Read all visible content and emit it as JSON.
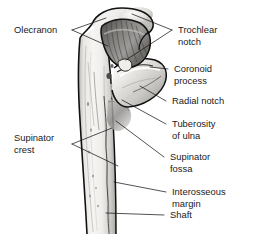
{
  "figure": {
    "background_color": "#ffffff",
    "text_color": "#1a1a1a",
    "line_color": "#1a1a1a",
    "bone_fill_light": "#f2f1ef",
    "bone_fill_mid": "#d9d7d4",
    "bone_fill_dark": "#8d8b89",
    "notch_shadow": "#6f6e6c"
  },
  "labels": {
    "left": [
      {
        "id": "olecranon",
        "line1": "Olecranon",
        "line2": ""
      },
      {
        "id": "supinator-crest",
        "line1": "Supinator",
        "line2": "crest"
      }
    ],
    "right": [
      {
        "id": "trochlear-notch",
        "line1": "Trochlear",
        "line2": "notch"
      },
      {
        "id": "coronoid-process",
        "line1": "Coronoid",
        "line2": "process"
      },
      {
        "id": "radial-notch",
        "line1": "Radial notch",
        "line2": ""
      },
      {
        "id": "tuberosity-of-ulna",
        "line1": "Tuberosity",
        "line2": "of ulna"
      },
      {
        "id": "supinator-fossa",
        "line1": "Supinator",
        "line2": "fossa"
      },
      {
        "id": "interosseous-margin",
        "line1": "Interosseous",
        "line2": "margin"
      },
      {
        "id": "shaft",
        "line1": "Shaft",
        "line2": ""
      }
    ]
  },
  "structures": [
    {
      "id": "olecranon",
      "name": "Olecranon"
    },
    {
      "id": "trochlear-notch",
      "name": "Trochlear notch"
    },
    {
      "id": "coronoid-process",
      "name": "Coronoid process"
    },
    {
      "id": "radial-notch",
      "name": "Radial notch"
    },
    {
      "id": "tuberosity-of-ulna",
      "name": "Tuberosity of ulna"
    },
    {
      "id": "supinator-fossa",
      "name": "Supinator fossa"
    },
    {
      "id": "supinator-crest",
      "name": "Supinator crest"
    },
    {
      "id": "interosseous-margin",
      "name": "Interosseous margin"
    },
    {
      "id": "shaft",
      "name": "Shaft"
    }
  ]
}
